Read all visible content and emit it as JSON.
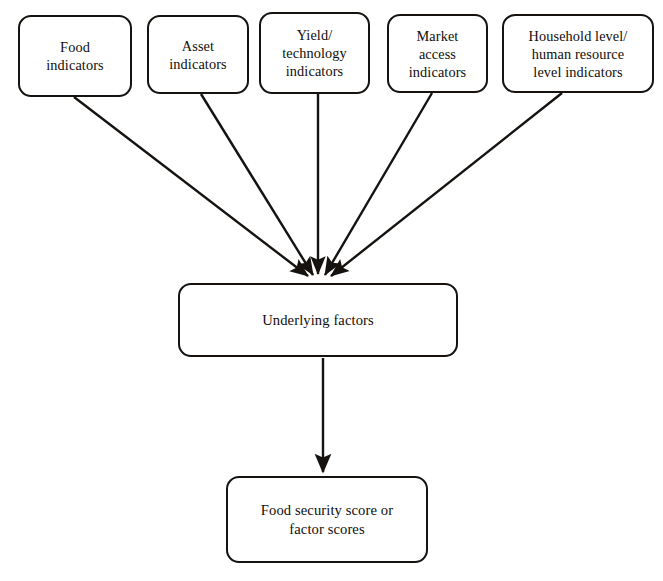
{
  "diagram": {
    "orientation": "top-down",
    "background_color": "#ffffff",
    "stroke_color": "#15120f",
    "text_color": "#100e0c",
    "indicator_nodes": [
      {
        "id": "food-indicators",
        "label": "Food\nindicators",
        "x": 18,
        "y": 15,
        "w": 114,
        "h": 82,
        "edge_start": {
          "x": 74,
          "y": 97
        }
      },
      {
        "id": "asset-indicators",
        "label": "Asset\nindicators",
        "x": 147,
        "y": 15,
        "w": 102,
        "h": 79,
        "edge_start": {
          "x": 201,
          "y": 94
        }
      },
      {
        "id": "yield-technology-indicators",
        "label": "Yield/\ntechnology\nindicators",
        "x": 259,
        "y": 12,
        "w": 111,
        "h": 82,
        "edge_start": {
          "x": 318,
          "y": 94
        }
      },
      {
        "id": "market-access-indicators",
        "label": "Market\naccess\nindicators",
        "x": 387,
        "y": 14,
        "w": 101,
        "h": 79,
        "edge_start": {
          "x": 432,
          "y": 93
        }
      },
      {
        "id": "household-human-resource-indicators",
        "label": "Household level/\nhuman resource\nlevel indicators",
        "x": 502,
        "y": 14,
        "w": 152,
        "h": 79,
        "edge_start": {
          "x": 562,
          "y": 93
        }
      }
    ],
    "middle_node": {
      "id": "underlying-factors",
      "label": "Underlying factors",
      "x": 178,
      "y": 283,
      "w": 280,
      "h": 74
    },
    "outcome_node": {
      "id": "food-security-score",
      "label": "Food security score or\nfactor scores",
      "x": 226,
      "y": 476,
      "w": 202,
      "h": 87
    },
    "convergence_point": {
      "x": 318,
      "y": 282
    },
    "vertical_edge": {
      "x": 323,
      "y_start": 358,
      "y_end": 474
    }
  }
}
